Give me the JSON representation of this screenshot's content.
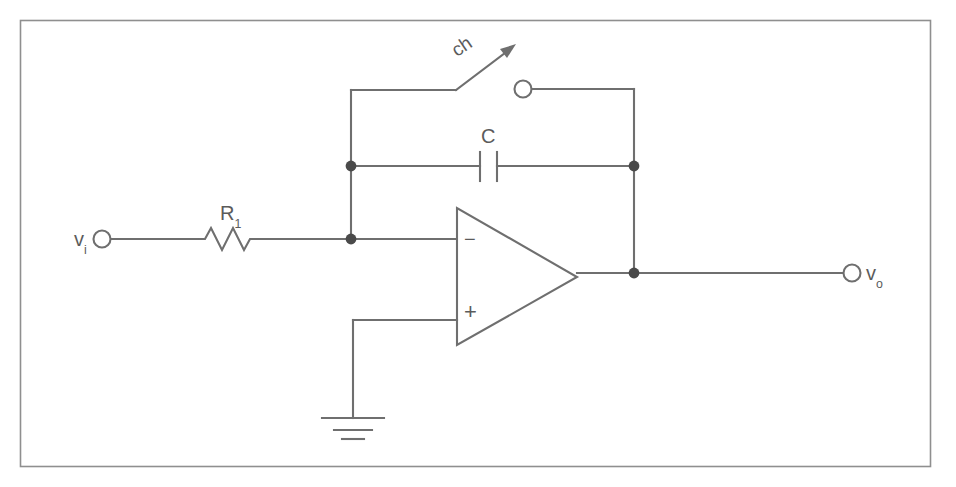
{
  "figure": {
    "kind": "electronic-schematic",
    "title_text": "",
    "frame": {
      "stroke_color": "#8a8a8a"
    },
    "wire_color": "#6f6f6f",
    "label_color": "#5b5b5b",
    "background_color": "#ffffff"
  },
  "labels": {
    "input_main": "v",
    "input_sub": "i",
    "output_main": "v",
    "output_sub": "o",
    "resistor_main": "R",
    "resistor_sub": "1",
    "capacitor": "C",
    "switch": "ch",
    "opamp_inverting": "−",
    "opamp_noninverting": "+"
  },
  "components": [
    {
      "name": "input-terminal",
      "type": "terminal-open",
      "label": "v i"
    },
    {
      "name": "resistor-r1",
      "type": "resistor",
      "label": "R 1"
    },
    {
      "name": "capacitor-c",
      "type": "capacitor",
      "label": "C"
    },
    {
      "name": "switch-ch",
      "type": "switch-spst",
      "label": "ch"
    },
    {
      "name": "switch-terminal",
      "type": "terminal-open",
      "label": ""
    },
    {
      "name": "opamp",
      "type": "operational-amplifier",
      "label": ""
    },
    {
      "name": "ground",
      "type": "ground",
      "label": ""
    },
    {
      "name": "output-terminal",
      "type": "terminal-open",
      "label": "v o"
    }
  ],
  "junctions": [
    {
      "name": "junction-inverting-top",
      "x": 351,
      "y": 166
    },
    {
      "name": "junction-inverting-node",
      "x": 351,
      "y": 239
    },
    {
      "name": "junction-output-top",
      "x": 634,
      "y": 166
    },
    {
      "name": "junction-output-node",
      "x": 634,
      "y": 273
    }
  ]
}
